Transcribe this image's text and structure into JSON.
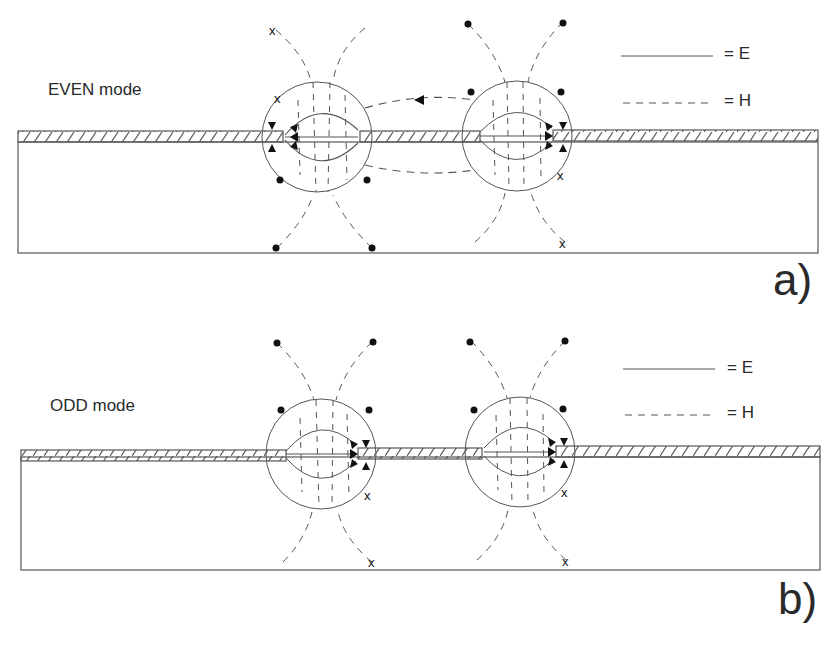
{
  "figure": {
    "type": "coupled slot line field pattern diagram",
    "colors": {
      "stroke": "#555555",
      "ink": "#222222",
      "background": "#ffffff"
    },
    "panels": [
      {
        "id": "a",
        "tag": "a)",
        "mode_label": "EVEN mode",
        "legend": {
          "e_label": "= E",
          "h_label": "= H",
          "e_style": "solid",
          "h_style": "dashed"
        },
        "slots": [
          {
            "name": "left-slot",
            "e_field_direction": "left"
          },
          {
            "name": "right-slot",
            "e_field_direction": "right"
          }
        ],
        "h_field_markers": {
          "dot": "field out of page",
          "x": "field into page"
        }
      },
      {
        "id": "b",
        "tag": "b)",
        "mode_label": "ODD mode",
        "legend": {
          "e_label": "= E",
          "h_label": "= H",
          "e_style": "solid",
          "h_style": "dashed"
        },
        "slots": [
          {
            "name": "left-slot",
            "e_field_direction": "right"
          },
          {
            "name": "right-slot",
            "e_field_direction": "right"
          }
        ],
        "h_field_markers": {
          "dot": "field out of page",
          "x": "field into page"
        }
      }
    ]
  }
}
